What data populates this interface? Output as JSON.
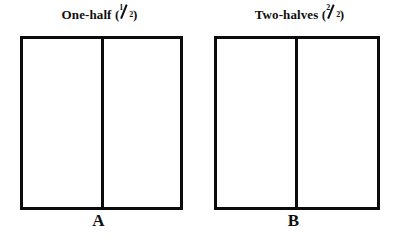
{
  "figures": [
    {
      "title_text": "One-half",
      "fraction": {
        "numerator": "1",
        "denominator": "2"
      },
      "label": "A",
      "parts_total": 2,
      "parts_shaded": 0
    },
    {
      "title_text": "Two-halves",
      "fraction": {
        "numerator": "2",
        "denominator": "2"
      },
      "label": "B",
      "parts_total": 2,
      "parts_shaded": 0
    }
  ],
  "colors": {
    "ink": "#100f0f",
    "outline": "#0c0b0b",
    "background": "#ffffff"
  }
}
